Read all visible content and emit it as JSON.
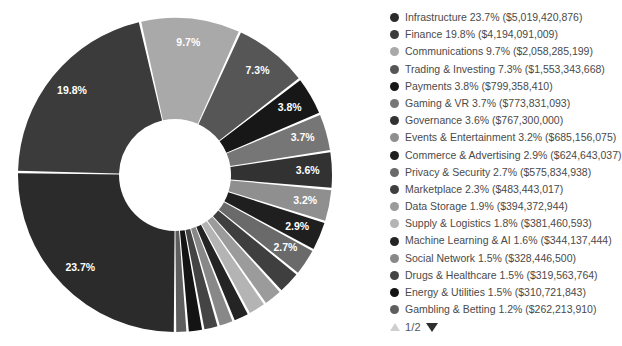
{
  "chart_data": {
    "type": "pie",
    "variant": "donut",
    "title": "",
    "xlabel": "",
    "ylabel": "",
    "legend_position": "right",
    "grid": false,
    "value_unit": "USD",
    "categories": [
      "Infrastructure",
      "Finance",
      "Communications",
      "Trading & Investing",
      "Payments",
      "Gaming & VR",
      "Governance",
      "Events & Entertainment",
      "Commerce & Advertising",
      "Privacy & Security",
      "Marketplace",
      "Data Storage",
      "Supply & Logistics",
      "Machine Learning & AI",
      "Social Network",
      "Drugs & Healthcare",
      "Energy & Utilities",
      "Gambling & Betting"
    ],
    "percents": [
      23.7,
      19.8,
      9.7,
      7.3,
      3.8,
      3.7,
      3.6,
      3.2,
      2.9,
      2.7,
      2.3,
      1.9,
      1.8,
      1.6,
      1.5,
      1.5,
      1.5,
      1.2
    ],
    "values": [
      5019420876,
      4194091009,
      2058285199,
      1553343668,
      799358410,
      773831093,
      767300000,
      685156075,
      624643037,
      575834938,
      483443017,
      394372944,
      381460593,
      344137444,
      328446500,
      319563764,
      310721843,
      262213910
    ],
    "colors": [
      "#2b2b2b",
      "#3b3b3b",
      "#a9a9a9",
      "#565656",
      "#171717",
      "#767676",
      "#323232",
      "#8f8f8f",
      "#1f1f1f",
      "#6a6a6a",
      "#3f3f3f",
      "#9b9b9b",
      "#b4b4b4",
      "#242424",
      "#888888",
      "#444444",
      "#141414",
      "#5e5e5e"
    ],
    "slice_labels_shown": [
      "23.7%",
      "19.8%",
      "9.7%",
      "7.3%",
      "3.8%",
      "3.7%",
      "3.6%",
      "3.2%",
      "2.9%",
      "2.7%"
    ],
    "legend_entries": [
      {
        "label": "Infrastructure",
        "percent": "23.7%",
        "value": "($5,019,420,876)",
        "color": "#2b2b2b"
      },
      {
        "label": "Finance",
        "percent": "19.8%",
        "value": "($4,194,091,009)",
        "color": "#3b3b3b"
      },
      {
        "label": "Communications",
        "percent": "9.7%",
        "value": "($2,058,285,199)",
        "color": "#a9a9a9"
      },
      {
        "label": "Trading & Investing",
        "percent": "7.3%",
        "value": "($1,553,343,668)",
        "color": "#565656"
      },
      {
        "label": "Payments",
        "percent": "3.8%",
        "value": "($799,358,410)",
        "color": "#171717"
      },
      {
        "label": "Gaming & VR",
        "percent": "3.7%",
        "value": "($773,831,093)",
        "color": "#767676"
      },
      {
        "label": "Governance",
        "percent": "3.6%",
        "value": "($767,300,000)",
        "color": "#323232"
      },
      {
        "label": "Events & Entertainment",
        "percent": "3.2%",
        "value": "($685,156,075)",
        "color": "#8f8f8f"
      },
      {
        "label": "Commerce & Advertising",
        "percent": "2.9%",
        "value": "($624,643,037)",
        "color": "#1f1f1f"
      },
      {
        "label": "Privacy & Security",
        "percent": "2.7%",
        "value": "($575,834,938)",
        "color": "#6a6a6a"
      },
      {
        "label": "Marketplace",
        "percent": "2.3%",
        "value": "($483,443,017)",
        "color": "#3f3f3f"
      },
      {
        "label": "Data Storage",
        "percent": "1.9%",
        "value": "($394,372,944)",
        "color": "#9b9b9b"
      },
      {
        "label": "Supply & Logistics",
        "percent": "1.8%",
        "value": "($381,460,593)",
        "color": "#b4b4b4"
      },
      {
        "label": "Machine Learning & AI",
        "percent": "1.6%",
        "value": "($344,137,444)",
        "color": "#242424"
      },
      {
        "label": "Social Network",
        "percent": "1.5%",
        "value": "($328,446,500)",
        "color": "#888888"
      },
      {
        "label": "Drugs & Healthcare",
        "percent": "1.5%",
        "value": "($319,563,764)",
        "color": "#444444"
      },
      {
        "label": "Energy & Utilities",
        "percent": "1.5%",
        "value": "($310,721,843)",
        "color": "#141414"
      },
      {
        "label": "Gambling & Betting",
        "percent": "1.2%",
        "value": "($262,213,910)",
        "color": "#5e5e5e"
      }
    ]
  },
  "geometry": {
    "cx": 175,
    "cy": 175,
    "outer_radius": 157,
    "inner_radius": 56,
    "start_angle_deg": 180,
    "direction": "clockwise",
    "gap_deg": 0.9,
    "label_min_percent": 2.7,
    "label_radius_factor": 0.76
  },
  "pager": {
    "label": "1/2",
    "up_icon": "triangle-up-icon",
    "down_icon": "triangle-down-icon"
  }
}
